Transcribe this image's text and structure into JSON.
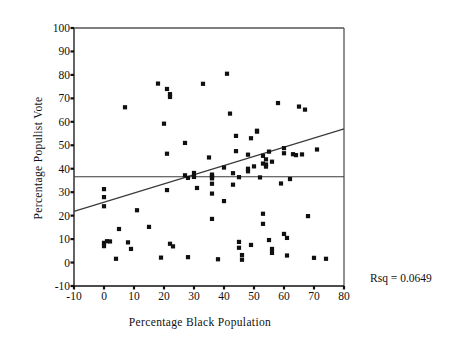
{
  "figure": {
    "background": "#ffffff",
    "ink": "#101010",
    "marker_color": "#101010",
    "line_color": "#3a3a3a"
  },
  "annotation": {
    "rsq_label": "Rsq = 0.0649"
  },
  "chart_data": {
    "type": "scatter",
    "title": "",
    "xlabel": "Percentage Black Population",
    "ylabel": "Percentage Populist Vote",
    "xlim": [
      -10,
      80
    ],
    "ylim": [
      -10,
      100
    ],
    "xticks": [
      -10,
      0,
      10,
      20,
      30,
      40,
      50,
      60,
      70,
      80
    ],
    "yticks": [
      -10,
      0,
      10,
      20,
      30,
      40,
      50,
      60,
      70,
      80,
      90,
      100
    ],
    "grid": false,
    "legend": null,
    "annotations": [
      "Rsq = 0.0649"
    ],
    "reference_line": {
      "type": "horizontal",
      "y": 36.6,
      "label": "mean populist vote"
    },
    "fit_line": {
      "type": "linear-regression",
      "x_start": -10,
      "y_start": 21.8,
      "x_end": 80,
      "y_end": 57.0,
      "slope": 0.391,
      "intercept": 25.7,
      "rsq": 0.0649
    },
    "series": [
      {
        "name": "counties",
        "marker": "square",
        "points": [
          [
            0,
            31.3
          ],
          [
            0,
            27.9
          ],
          [
            0,
            24.0
          ],
          [
            0,
            8.4
          ],
          [
            0,
            7.0
          ],
          [
            1,
            9.1
          ],
          [
            2,
            9.0
          ],
          [
            4,
            1.6
          ],
          [
            5,
            14.3
          ],
          [
            7,
            66.2
          ],
          [
            8,
            8.6
          ],
          [
            9,
            5.8
          ],
          [
            11,
            22.3
          ],
          [
            15,
            15.2
          ],
          [
            18,
            76.3
          ],
          [
            19,
            2.1
          ],
          [
            20,
            59.2
          ],
          [
            21,
            74.0
          ],
          [
            22,
            70.6
          ],
          [
            22,
            71.8
          ],
          [
            21,
            46.4
          ],
          [
            21,
            30.9
          ],
          [
            22,
            8.0
          ],
          [
            23,
            6.9
          ],
          [
            27,
            51.0
          ],
          [
            27,
            37.2
          ],
          [
            28,
            36.1
          ],
          [
            28,
            2.3
          ],
          [
            30,
            38.2
          ],
          [
            30,
            36.5
          ],
          [
            31,
            31.8
          ],
          [
            33,
            76.2
          ],
          [
            35,
            44.8
          ],
          [
            36,
            37.5
          ],
          [
            36,
            37.0
          ],
          [
            36,
            36.3
          ],
          [
            36,
            35.9
          ],
          [
            36,
            33.6
          ],
          [
            36,
            29.4
          ],
          [
            36,
            18.6
          ],
          [
            38,
            1.4
          ],
          [
            40,
            40.5
          ],
          [
            40,
            26.2
          ],
          [
            41,
            80.5
          ],
          [
            42,
            63.5
          ],
          [
            43,
            38.1
          ],
          [
            43,
            33.2
          ],
          [
            44,
            54.0
          ],
          [
            44,
            47.5
          ],
          [
            45,
            36.4
          ],
          [
            45,
            8.8
          ],
          [
            45,
            6.3
          ],
          [
            46,
            3.2
          ],
          [
            46,
            1.2
          ],
          [
            48,
            46.0
          ],
          [
            48,
            40.0
          ],
          [
            48,
            38.9
          ],
          [
            49,
            53.0
          ],
          [
            49,
            7.5
          ],
          [
            50,
            41.0
          ],
          [
            51,
            56.2
          ],
          [
            51,
            55.8
          ],
          [
            52,
            36.3
          ],
          [
            53,
            45.5
          ],
          [
            53,
            42.2
          ],
          [
            53,
            20.8
          ],
          [
            53,
            16.5
          ],
          [
            54,
            44.0
          ],
          [
            54,
            41.8
          ],
          [
            54,
            40.9
          ],
          [
            55,
            47.3
          ],
          [
            55,
            9.6
          ],
          [
            56,
            43.0
          ],
          [
            56,
            5.8
          ],
          [
            56,
            4.1
          ],
          [
            58,
            68.0
          ],
          [
            59,
            33.7
          ],
          [
            60,
            48.8
          ],
          [
            60,
            46.6
          ],
          [
            60,
            12.2
          ],
          [
            61,
            10.5
          ],
          [
            61,
            3.0
          ],
          [
            62,
            35.6
          ],
          [
            63,
            46.2
          ],
          [
            64,
            45.8
          ],
          [
            65,
            66.5
          ],
          [
            66,
            46.1
          ],
          [
            67,
            65.2
          ],
          [
            68,
            19.8
          ],
          [
            70,
            2.0
          ],
          [
            71,
            48.2
          ],
          [
            74,
            1.6
          ]
        ]
      }
    ]
  }
}
